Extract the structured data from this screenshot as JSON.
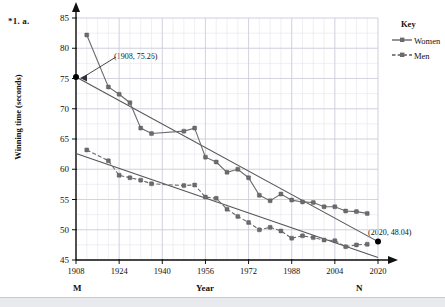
{
  "question_label": "*1. a.",
  "axis": {
    "y_title": "Winning time (seconds)",
    "x_title": "Year",
    "y_ticks": [
      45,
      50,
      55,
      60,
      65,
      70,
      75,
      80,
      85
    ],
    "x_ticks": [
      1908,
      1924,
      1940,
      1956,
      1972,
      1988,
      2004,
      2020
    ],
    "left_endpoint_label": "M",
    "right_endpoint_label": "N"
  },
  "legend": {
    "title": "Key",
    "items": [
      {
        "label": "Women",
        "style": "solid",
        "color": "#5a5a5a"
      },
      {
        "label": "Men",
        "style": "dashed",
        "color": "#5a5a5a"
      }
    ]
  },
  "annotations": [
    {
      "text": "(1908, 75.26)",
      "point_x": 1908,
      "point_y": 75.26
    },
    {
      "text": "(2020, 48.04)",
      "point_x": 2020,
      "point_y": 48.04
    }
  ],
  "chart_data": {
    "type": "line",
    "title": "",
    "xlabel": "Year",
    "ylabel": "Winning time (seconds)",
    "xlim": [
      1908,
      2020
    ],
    "ylim": [
      45,
      85
    ],
    "grid": true,
    "legend_position": "right",
    "series": [
      {
        "name": "Women",
        "style": "solid",
        "color": "#6b6b6b",
        "points": [
          [
            1912,
            82.2
          ],
          [
            1920,
            73.6
          ],
          [
            1924,
            72.4
          ],
          [
            1928,
            71.0
          ],
          [
            1932,
            66.8
          ],
          [
            1936,
            65.9
          ],
          [
            1948,
            66.3
          ],
          [
            1952,
            66.8
          ],
          [
            1956,
            62.0
          ],
          [
            1960,
            61.2
          ],
          [
            1964,
            59.5
          ],
          [
            1968,
            60.0
          ],
          [
            1972,
            58.6
          ],
          [
            1976,
            55.7
          ],
          [
            1980,
            54.8
          ],
          [
            1984,
            55.9
          ],
          [
            1988,
            54.9
          ],
          [
            1992,
            54.6
          ],
          [
            1996,
            54.5
          ],
          [
            2000,
            53.8
          ],
          [
            2004,
            53.8
          ],
          [
            2008,
            53.1
          ],
          [
            2012,
            53.0
          ],
          [
            2016,
            52.7
          ]
        ]
      },
      {
        "name": "Men",
        "style": "dashed",
        "color": "#6b6b6b",
        "points": [
          [
            1912,
            63.2
          ],
          [
            1920,
            61.4
          ],
          [
            1924,
            59.0
          ],
          [
            1928,
            58.6
          ],
          [
            1932,
            58.2
          ],
          [
            1936,
            57.6
          ],
          [
            1948,
            57.3
          ],
          [
            1952,
            57.4
          ],
          [
            1956,
            55.4
          ],
          [
            1960,
            55.2
          ],
          [
            1964,
            53.4
          ],
          [
            1968,
            52.2
          ],
          [
            1972,
            51.2
          ],
          [
            1976,
            49.99
          ],
          [
            1980,
            50.4
          ],
          [
            1984,
            49.8
          ],
          [
            1988,
            48.6
          ],
          [
            1992,
            49.0
          ],
          [
            1996,
            48.7
          ],
          [
            2000,
            48.3
          ],
          [
            2004,
            48.2
          ],
          [
            2008,
            47.2
          ],
          [
            2012,
            47.5
          ],
          [
            2016,
            47.6
          ]
        ]
      }
    ],
    "trend_lines": [
      {
        "name": "Women trend",
        "from": [
          1908,
          75.26
        ],
        "to": [
          2020,
          48.04
        ],
        "color": "#555"
      },
      {
        "name": "Men trend",
        "from": [
          1908,
          62.6
        ],
        "to": [
          2020,
          45.4
        ],
        "color": "#555"
      }
    ]
  }
}
